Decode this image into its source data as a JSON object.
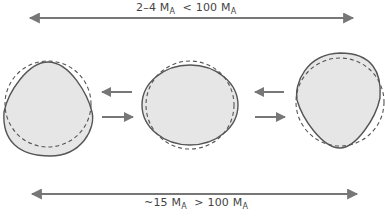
{
  "top_axis": {
    "range_text": "2–4",
    "unit": "M",
    "unit_sub": "A",
    "compare_text": "< 100",
    "compare_unit": "M",
    "compare_unit_sub": "A"
  },
  "bottom_axis": {
    "range_text": "~15",
    "unit": "M",
    "unit_sub": "A",
    "compare_text": "> 100",
    "compare_unit": "M",
    "compare_unit_sub": "A"
  },
  "shapes": [
    {
      "name": "prolate-up-shape",
      "description": "drop/teardrop shape pointed upward, over dashed sphere"
    },
    {
      "name": "oblate-shape",
      "description": "horizontally elongated ellipsoid, over dashed sphere"
    },
    {
      "name": "prolate-down-shape",
      "description": "teardrop pointing downward, over dashed sphere"
    }
  ],
  "colors": {
    "fill": "#e6e6e6",
    "stroke": "#555555",
    "arrow": "#777777"
  }
}
